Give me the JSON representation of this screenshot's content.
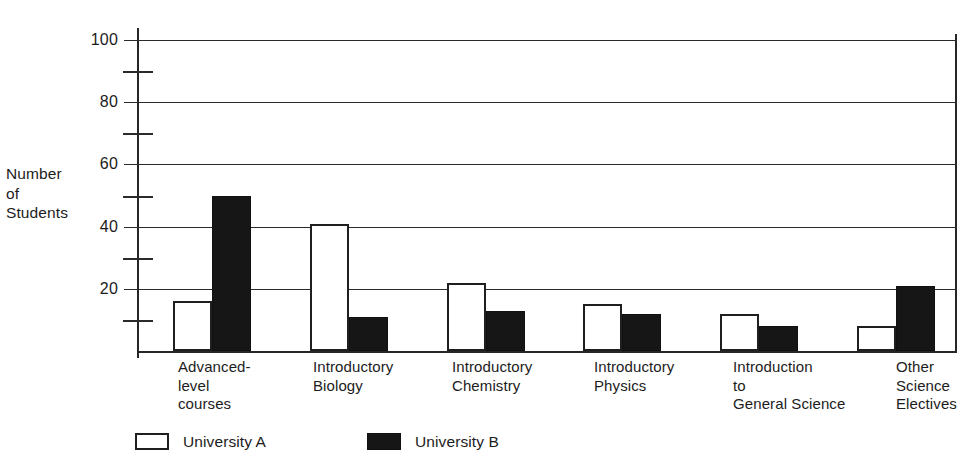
{
  "chart_data": {
    "type": "bar",
    "title": "",
    "subtitle": "",
    "xlabel": "",
    "ylabel": "Number of Students",
    "ylabel_lines": [
      "Number",
      "of",
      "Students"
    ],
    "ylim": [
      0,
      100
    ],
    "y_major_ticks": [
      0,
      20,
      40,
      60,
      80,
      100
    ],
    "y_major_tick_labels": [
      "",
      "20",
      "40",
      "60",
      "80",
      "100"
    ],
    "y_minor_ticks": [
      10,
      30,
      50,
      70,
      90
    ],
    "grid": "horizontal-major",
    "legend_position": "bottom-left",
    "categories": [
      "Advanced-level courses",
      "Introductory Biology",
      "Introductory Chemistry",
      "Introductory Physics",
      "Introduction to General Science",
      "Other Science Electives"
    ],
    "category_label_lines": [
      [
        "Advanced-",
        "level",
        "courses"
      ],
      [
        "Introductory",
        "Biology"
      ],
      [
        "Introductory",
        "Chemistry"
      ],
      [
        "Introductory",
        "Physics"
      ],
      [
        "Introduction",
        "to",
        "General Science"
      ],
      [
        "Other",
        "Science",
        "Electives"
      ]
    ],
    "series": [
      {
        "name": "University A",
        "color": "#ffffff",
        "edge_color": "#1f1f1f",
        "values": [
          16,
          41,
          22,
          15,
          12,
          8
        ]
      },
      {
        "name": "University B",
        "color": "#161616",
        "edge_color": "#111111",
        "values": [
          50,
          11,
          13,
          12,
          8,
          21
        ]
      }
    ],
    "annotations": []
  },
  "legend": {
    "entries": [
      {
        "label": "University A",
        "swatch": "white-outlined-square"
      },
      {
        "label": "University B",
        "swatch": "black-filled-square"
      }
    ]
  },
  "colors": {
    "axis": "#262626",
    "grid": "#2b2b2b",
    "text": "#1c1c1c",
    "series_a": "#ffffff",
    "series_b": "#161616",
    "background": "#ffffff"
  }
}
